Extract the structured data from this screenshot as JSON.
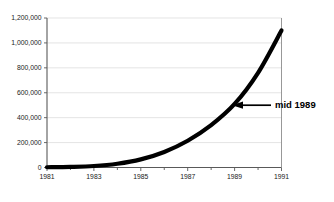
{
  "chart_data": {
    "type": "line",
    "title": "",
    "subtitle": "",
    "xlabel": "",
    "ylabel": "",
    "xlim": [
      1981,
      1991
    ],
    "ylim": [
      0,
      1200000
    ],
    "grid": true,
    "legend": false,
    "legend_position": "none",
    "series": [
      {
        "name": "growth-curve",
        "color": "#000000",
        "x": [
          1981,
          1982,
          1983,
          1984,
          1985,
          1986,
          1987,
          1988,
          1989,
          1990,
          1991
        ],
        "values": [
          2000,
          5000,
          12000,
          30000,
          65000,
          125000,
          215000,
          340000,
          510000,
          760000,
          1100000
        ]
      }
    ],
    "x_tick_labels": [
      "1981",
      "1983",
      "1985",
      "1987",
      "1989",
      "1991"
    ],
    "x_tick_values": [
      1981,
      1983,
      1985,
      1987,
      1989,
      1991
    ],
    "x_minor_tick_values": [
      1982,
      1984,
      1986,
      1988,
      1990
    ],
    "y_tick_labels": [
      "0",
      "200,000",
      "400,000",
      "600,000",
      "800,000",
      "1,000,000",
      "1,200,000"
    ],
    "y_tick_values": [
      0,
      200000,
      400000,
      600000,
      800000,
      1000000,
      1200000
    ],
    "annotations": [
      {
        "text": "mid 1989",
        "target_x": 1989.1,
        "target_y": 500000,
        "arrow": "left-pointing-arrow"
      }
    ],
    "colors": {
      "curve": "#000000",
      "gridline": "#d8d8d8",
      "axis": "#595959",
      "frame": "#8c8c8c",
      "text": "#1a1a1a",
      "background": "#ffffff"
    }
  }
}
